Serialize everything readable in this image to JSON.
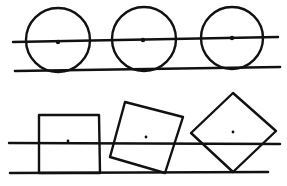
{
  "figure": {
    "colors": {
      "ink": "#111111",
      "background": "#ffffff"
    },
    "panels": [
      {
        "id": "circles",
        "upper_line": {
          "x1": 13,
          "y1": 42,
          "x2": 278,
          "y2": 37
        },
        "lower_line": {
          "x1": 15,
          "y1": 71,
          "x2": 280,
          "y2": 67
        },
        "shapes": [
          {
            "type": "circle",
            "cx": 58,
            "cy": 40,
            "r": 32,
            "dot": [
              58,
              42
            ]
          },
          {
            "type": "circle",
            "cx": 144,
            "cy": 39,
            "r": 32,
            "dot": [
              143,
              40
            ]
          },
          {
            "type": "circle",
            "cx": 232,
            "cy": 38,
            "r": 31,
            "dot": [
              232,
              38
            ]
          }
        ]
      },
      {
        "id": "squares",
        "upper_line": {
          "x1": 9,
          "y1": 143,
          "x2": 280,
          "y2": 144
        },
        "lower_line": {
          "x1": 10,
          "y1": 173,
          "x2": 268,
          "y2": 172
        },
        "shapes": [
          {
            "type": "polygon",
            "label": "square-upright",
            "points": "39,173 39,115 99,115 100,173",
            "dot": [
              68,
              141
            ]
          },
          {
            "type": "polygon",
            "label": "square-tilted",
            "points": "125,102 183,117 165,173 110,157",
            "dot": [
              146,
              137
            ]
          },
          {
            "type": "polygon",
            "label": "square-diamond",
            "points": "233,93 276,131 233,172 191,133",
            "dot": [
              233,
              132
            ]
          }
        ]
      }
    ]
  }
}
